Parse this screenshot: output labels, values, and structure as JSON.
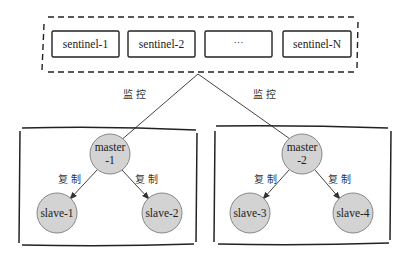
{
  "diagram": {
    "sentinels": [
      {
        "label": "sentinel-1"
      },
      {
        "label": "sentinel-2"
      },
      {
        "label": "···"
      },
      {
        "label": "sentinel-N"
      }
    ],
    "monitor_labels": [
      "监控",
      "监控"
    ],
    "groups": [
      {
        "master": {
          "line1": "master",
          "line2": "-1"
        },
        "replicate_labels": [
          "复制",
          "复制"
        ],
        "slaves": [
          "slave-1",
          "slave-2"
        ]
      },
      {
        "master": {
          "line1": "master",
          "line2": "-2"
        },
        "replicate_labels": [
          "复制",
          "复制"
        ],
        "slaves": [
          "slave-3",
          "slave-4"
        ]
      }
    ],
    "colors": {
      "stroke": "#222222",
      "node_fill": "#d3d3d3",
      "node_stroke": "#888888",
      "arrow": "#444444"
    }
  }
}
